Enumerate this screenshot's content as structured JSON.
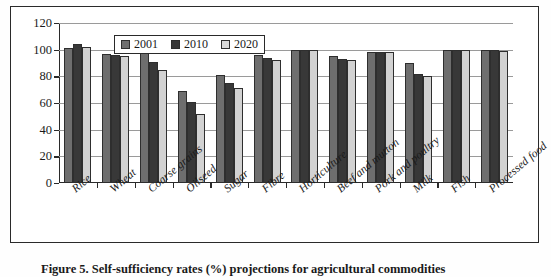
{
  "figure": {
    "caption": "Figure 5.  Self-sufficiency rates (%) projections for agricultural commodities"
  },
  "legend": {
    "position": "top-center-inside",
    "entries": [
      {
        "label": "2001",
        "color": "#6e6e6e"
      },
      {
        "label": "2010",
        "color": "#383838"
      },
      {
        "label": "2020",
        "color": "#d8d8d8"
      }
    ]
  },
  "axis": {
    "y_ticks": [
      "0",
      "20",
      "40",
      "60",
      "80",
      "100",
      "120"
    ]
  },
  "chart_data": {
    "type": "bar",
    "title": "",
    "subtitle": "",
    "xlabel": "",
    "ylabel": "",
    "ylim": [
      0,
      120
    ],
    "ytick_step": 20,
    "grid": true,
    "grid_axis": "y",
    "legend_position": "top-center",
    "categories": [
      "Rice",
      "Wheat",
      "Coarse grains",
      "Oilseed",
      "Sugar",
      "Fibre",
      "Horticulture",
      "Beef and mutton",
      "Pork and poultry",
      "Milk",
      "Fish",
      "Processed food"
    ],
    "series": [
      {
        "name": "2001",
        "color": "#6e6e6e",
        "values": [
          101,
          97,
          101,
          69,
          81,
          96,
          100,
          95,
          98,
          90,
          100,
          100
        ]
      },
      {
        "name": "2010",
        "color": "#383838",
        "values": [
          104,
          96,
          91,
          61,
          75,
          94,
          100,
          93,
          98,
          82,
          100,
          100
        ]
      },
      {
        "name": "2020",
        "color": "#d2d2d2",
        "values": [
          102,
          95,
          85,
          52,
          71,
          92,
          100,
          92,
          98,
          80,
          100,
          99
        ]
      }
    ]
  }
}
